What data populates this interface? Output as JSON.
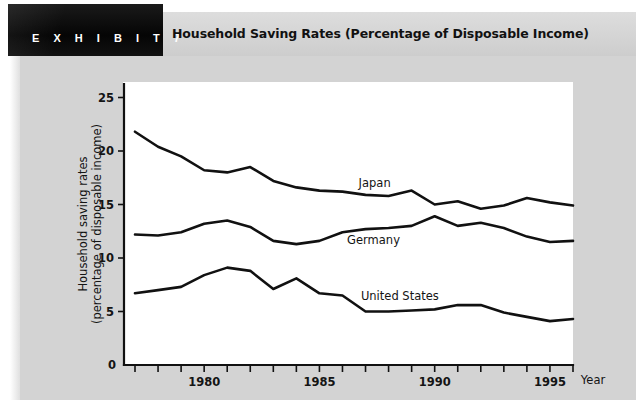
{
  "exhibit": {
    "badge_label": "E X H I B I T   7",
    "title": "Household Saving Rates (Percentage of Disposable Income)"
  },
  "axes": {
    "y_title_line1": "Household saving rates",
    "y_title_line2": "(percentage of disposable income)",
    "x_title": "Year",
    "zero_label": "0",
    "y_ticks": [
      "5",
      "10",
      "15",
      "20",
      "25"
    ],
    "x_ticks": [
      "1980",
      "1985",
      "1990",
      "1995"
    ]
  },
  "series_labels": {
    "japan": "Japan",
    "germany": "Germany",
    "united_states": "United States"
  },
  "colors": {
    "page_background": "#ffffff",
    "panel_background": "#d3d3d3",
    "header_band": "#d6d6d6",
    "badge_background": "#0d0d0d",
    "badge_text": "#ffffff",
    "plot_background": "#ffffff",
    "line": "#111111",
    "text": "#141414"
  },
  "chart_data": {
    "type": "line",
    "title": "Household Saving Rates (Percentage of Disposable Income)",
    "xlabel": "Year",
    "ylabel": "Household saving rates (percentage of disposable income)",
    "xlim": [
      1977,
      1996
    ],
    "ylim": [
      0,
      26.5
    ],
    "ytick_values": [
      5,
      10,
      15,
      20,
      25
    ],
    "xtick_values": [
      1980,
      1985,
      1990,
      1995
    ],
    "xtick_labeled": [
      1980,
      1985,
      1990,
      1995
    ],
    "grid": false,
    "legend": "inline-labels",
    "x": [
      1977,
      1978,
      1979,
      1980,
      1981,
      1982,
      1983,
      1984,
      1985,
      1986,
      1987,
      1988,
      1989,
      1990,
      1991,
      1992,
      1993,
      1994,
      1995,
      1996
    ],
    "series": [
      {
        "name": "Japan",
        "label_position": {
          "x": 1986.7,
          "y": 16.6
        },
        "values": [
          21.8,
          20.4,
          19.5,
          18.2,
          18.0,
          18.5,
          17.2,
          16.6,
          16.3,
          16.2,
          15.9,
          15.8,
          16.3,
          15.0,
          15.3,
          14.6,
          14.9,
          15.6,
          15.2,
          14.9
        ]
      },
      {
        "name": "Germany",
        "label_position": {
          "x": 1986.2,
          "y": 11.3
        },
        "values": [
          12.2,
          12.1,
          12.4,
          13.2,
          13.5,
          12.9,
          11.6,
          11.3,
          11.6,
          12.4,
          12.7,
          12.8,
          13.0,
          13.9,
          13.0,
          13.3,
          12.8,
          12.0,
          11.5,
          11.6
        ]
      },
      {
        "name": "United States",
        "label_position": {
          "x": 1986.8,
          "y": 6.1
        },
        "values": [
          6.7,
          7.0,
          7.3,
          8.4,
          9.1,
          8.8,
          7.1,
          8.1,
          6.7,
          6.5,
          5.0,
          5.0,
          5.1,
          5.2,
          5.6,
          5.6,
          4.9,
          4.5,
          4.1,
          4.3
        ]
      }
    ]
  }
}
